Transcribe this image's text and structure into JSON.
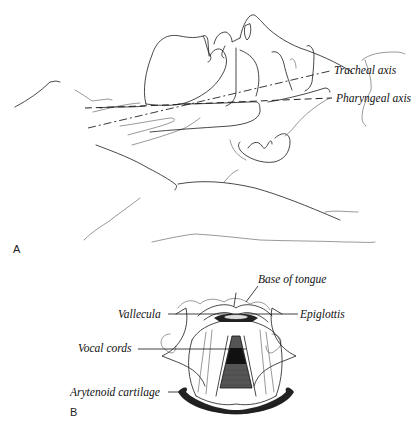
{
  "figure": {
    "panel_a": {
      "label": "A",
      "annotations": [
        {
          "id": "tracheal",
          "text": "Tracheal axis"
        },
        {
          "id": "pharyngeal",
          "text": "Pharyngeal axis"
        }
      ]
    },
    "panel_b": {
      "label": "B",
      "annotations": [
        {
          "id": "base_of_tongue",
          "text": "Base of tongue"
        },
        {
          "id": "vallecula",
          "text": "Vallecula"
        },
        {
          "id": "epiglottis",
          "text": "Epiglottis"
        },
        {
          "id": "vocal_cords",
          "text": "Vocal cords"
        },
        {
          "id": "arytenoid",
          "text": "Arytenoid cartilage"
        }
      ]
    }
  }
}
